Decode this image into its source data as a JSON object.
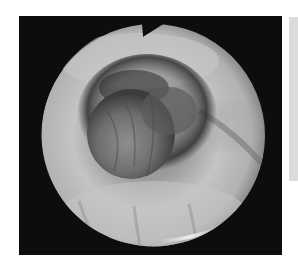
{
  "image": {
    "description": "Grayscale circular endoscopic view showing a rounded dark-ringed mass in a lumen",
    "frame_color": "#0d0d0d",
    "side_panel_color": "#dcdcdc",
    "field_shape": "circle-with-top-notch"
  }
}
